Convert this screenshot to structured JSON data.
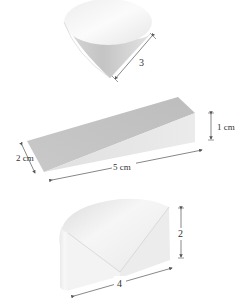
{
  "figures": [
    {
      "id": "cone",
      "shape": "cone",
      "dimensions": [
        {
          "label": "3",
          "meaning": "slant height"
        }
      ]
    },
    {
      "id": "wedge",
      "shape": "triangular prism (wedge)",
      "dimensions": [
        {
          "label": "1 cm",
          "meaning": "height"
        },
        {
          "label": "2 cm",
          "meaning": "width"
        },
        {
          "label": "5 cm",
          "meaning": "length"
        }
      ]
    },
    {
      "id": "quarter-cylinder",
      "shape": "quarter cylinder",
      "dimensions": [
        {
          "label": "2",
          "meaning": "height"
        },
        {
          "label": "4",
          "meaning": "radius"
        }
      ]
    }
  ],
  "colors": {
    "face_light": "#f4f4f4",
    "face_mid": "#d9d9d9",
    "face_dark": "#bdbdbd",
    "dimension_line": "#555555",
    "text": "#333333"
  }
}
